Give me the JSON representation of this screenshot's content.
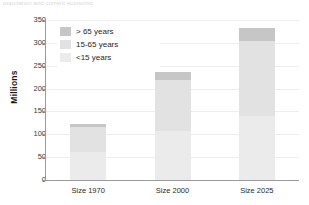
{
  "caption": {
    "text": "population and current economic"
  },
  "chart_data": {
    "type": "bar",
    "title": "",
    "subtitle": "",
    "xlabel": "",
    "ylabel": "Millions",
    "stacked": true,
    "grid": true,
    "legend_position": "top-left-inside",
    "ylim": [
      0,
      350
    ],
    "yticks": [
      0,
      50,
      100,
      150,
      200,
      250,
      300,
      350
    ],
    "ytick_labels": [
      "0",
      "50",
      "100",
      "150",
      "200",
      "250",
      "300",
      "350"
    ],
    "categories": [
      "Size 1970",
      "Size 2000",
      "Size 2025"
    ],
    "series": [
      {
        "name": "<15 years",
        "color": "#ebebeb",
        "values": [
          62,
          108,
          140
        ]
      },
      {
        "name": "15-65 years",
        "color": "#e2e2e2",
        "values": [
          53,
          111,
          164
        ]
      },
      {
        "name": "> 65 years",
        "color": "#c6c6c6",
        "values": [
          7,
          18,
          29
        ]
      }
    ],
    "totals": [
      122,
      237,
      333
    ],
    "colors": {
      "over65": "#c6c6c6",
      "mid": "#e2e2e2",
      "under15": "#ebebeb",
      "axis": "#9a9a9a",
      "grid": "#eeeeee",
      "text": "#2a2a2a",
      "background": "#ffffff"
    }
  },
  "legend": {
    "items": [
      {
        "label": "> 65 years",
        "color": "#c6c6c6"
      },
      {
        "label": "15-65 years",
        "color": "#e2e2e2"
      },
      {
        "label": "<15 years",
        "color": "#ebebeb"
      }
    ]
  }
}
